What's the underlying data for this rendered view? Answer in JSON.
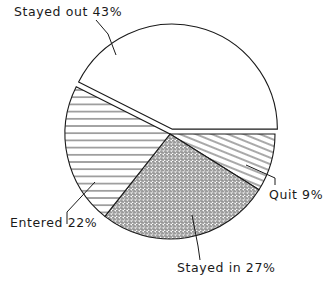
{
  "chart_data": {
    "type": "pie",
    "title": "",
    "categories": [
      "Stayed out",
      "Entered",
      "Stayed in",
      "Quit"
    ],
    "values": [
      43,
      22,
      27,
      9
    ],
    "unit": "%",
    "labels": [
      "Stayed out 43%",
      "Entered 22%",
      "Stayed in 27%",
      "Quit 9%"
    ],
    "slices": [
      {
        "label": "Quit",
        "value": 9,
        "pattern": "diagonal-hatch"
      },
      {
        "label": "Stayed in",
        "value": 27,
        "pattern": "dot-stipple"
      },
      {
        "label": "Entered",
        "value": 22,
        "pattern": "horizontal-hatch"
      },
      {
        "label": "Stayed out",
        "value": 43,
        "pattern": "none",
        "exploded": true
      }
    ],
    "start_angle": "3 o'clock",
    "direction": "clockwise",
    "legend": "none (direct labels with leader lines)"
  }
}
